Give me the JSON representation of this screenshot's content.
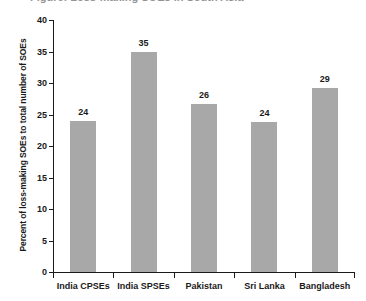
{
  "figure": {
    "cut_off_title": "Figure: Loss-making SOEs in South Asia",
    "background_color": "#ffffff",
    "bar_color": "#a8a8a8",
    "axis_color": "#1a1a1a"
  },
  "chart_data": {
    "type": "bar",
    "title": "",
    "xlabel": "",
    "ylabel": "Percent of loss-making SOEs to total number of SOEs",
    "categories": [
      "India CPSEs",
      "India SPSEs",
      "Pakistan",
      "Sri Lanka",
      "Bangladesh"
    ],
    "values": [
      24,
      35,
      26.7,
      23.8,
      29.2
    ],
    "data_labels": [
      "24",
      "35",
      "26",
      "24",
      "29"
    ],
    "ylim": [
      0,
      40
    ],
    "ytick_values": [
      0,
      5,
      10,
      15,
      20,
      25,
      30,
      35,
      40
    ],
    "ytick_labels": [
      "0",
      "5",
      "10",
      "15",
      "20",
      "25",
      "30",
      "35",
      "40"
    ],
    "grid": false,
    "legend": false,
    "legend_position": "none",
    "series": [
      {
        "name": "Percent of loss-making SOEs",
        "values": [
          24,
          35,
          26.7,
          23.8,
          29.2
        ]
      }
    ]
  }
}
